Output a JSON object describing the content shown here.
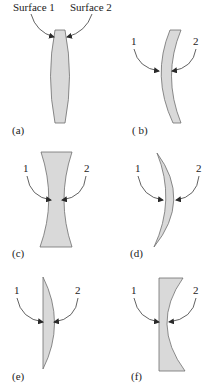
{
  "figure": {
    "colors": {
      "lens_fill": "#d9d9d9",
      "lens_stroke": "#6f6f6f",
      "arrow": "#3a3a3a",
      "text": "#222222"
    },
    "panels": [
      {
        "id": "a",
        "caption": "(a)",
        "lens_type": "biconvex",
        "surface_1_label": "Surface 1",
        "surface_2_label": "Surface 2"
      },
      {
        "id": "b",
        "caption": "( b)",
        "lens_type": "meniscus",
        "surface_1_label": "1",
        "surface_2_label": "2"
      },
      {
        "id": "c",
        "caption": "(c)",
        "lens_type": "biconcave",
        "surface_1_label": "1",
        "surface_2_label": "2"
      },
      {
        "id": "d",
        "caption": "(d)",
        "lens_type": "convex-meniscus",
        "surface_1_label": "1",
        "surface_2_label": "2"
      },
      {
        "id": "e",
        "caption": "(e)",
        "lens_type": "plano-convex",
        "surface_1_label": "1",
        "surface_2_label": "2"
      },
      {
        "id": "f",
        "caption": "(f)",
        "lens_type": "plano-concave",
        "surface_1_label": "1",
        "surface_2_label": "2"
      }
    ]
  }
}
